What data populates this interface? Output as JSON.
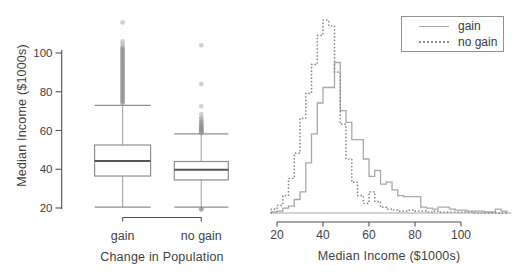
{
  "figure": {
    "width": 522,
    "height": 279,
    "background": "#ffffff",
    "colors": {
      "text": "#3f3f3f",
      "axis": "#4f4f4f",
      "solid_line": "#a8a8a8",
      "dotted_line": "#8a8a8a",
      "box_stroke": "#8f8f8f",
      "median_line": "#575757",
      "whisker": "#adadad",
      "outlier": "#8f8f8f"
    }
  },
  "chart_data": [
    {
      "type": "boxplot",
      "title": "",
      "xlabel": "Change in Population",
      "ylabel": "Median Income ($1000s)",
      "ylim": [
        15,
        118
      ],
      "y_ticks": [
        20,
        40,
        60,
        80,
        100
      ],
      "categories": [
        "gain",
        "no gain"
      ],
      "boxes": [
        {
          "group": "gain",
          "whisker_low": 20.5,
          "q1": 36.5,
          "median": 44.2,
          "q3": 52.5,
          "whisker_high": 73,
          "outliers": [
            74,
            74.5,
            75,
            75.5,
            76,
            76.5,
            77,
            77.5,
            78,
            78.5,
            79,
            79.5,
            80,
            80.5,
            81,
            81.5,
            82,
            82.5,
            83,
            83.5,
            84,
            84.5,
            85,
            85.5,
            86,
            86.5,
            87,
            87.5,
            88,
            88.5,
            89,
            89.5,
            90,
            90.5,
            91,
            91.5,
            92,
            92.5,
            93,
            93.5,
            94,
            94.5,
            95,
            95.5,
            96,
            96.5,
            97,
            97.5,
            98,
            98.5,
            99,
            99.5,
            100,
            100.5,
            101,
            101.5,
            102,
            102.5,
            103,
            104.5,
            106,
            115.8
          ]
        },
        {
          "group": "no gain",
          "whisker_low": 20.5,
          "q1": 34.5,
          "median": 39.8,
          "q3": 44,
          "whisker_high": 58.3,
          "outliers": [
            19.2,
            19.4,
            19.6,
            58.6,
            58.9,
            59.2,
            59.5,
            59.8,
            60.1,
            60.4,
            60.7,
            61,
            61.4,
            61.8,
            62.2,
            62.6,
            63,
            63.5,
            64,
            64.5,
            65.2,
            66,
            66.8,
            68.5,
            72.5,
            84,
            104
          ]
        }
      ]
    },
    {
      "type": "histogram",
      "title": "",
      "xlabel": "Median Income ($1000s)",
      "x_ticks": [
        20,
        40,
        60,
        80,
        100
      ],
      "xlim": [
        15,
        122
      ],
      "bin_start": 17.5,
      "bin_width": 2.5,
      "y_unit": "relative frequency (% of max)",
      "legend": {
        "position": "top-right",
        "items": [
          {
            "name": "gain",
            "line": "solid"
          },
          {
            "name": "no gain",
            "line": "dotted"
          }
        ]
      },
      "series": [
        {
          "name": "gain",
          "style": "solid",
          "heights": [
            0.5,
            1,
            2.5,
            3.5,
            7,
            11,
            26,
            41,
            57,
            65,
            65,
            78,
            53,
            47,
            38,
            38,
            28,
            19,
            22,
            15,
            16,
            12,
            9,
            8.5,
            8.5,
            8.5,
            3,
            2.5,
            2,
            3,
            3,
            2,
            1.5,
            1.5,
            1,
            1,
            1,
            0.5,
            0.5,
            2,
            1
          ]
        },
        {
          "name": "no gain",
          "style": "dotted",
          "heights": [
            2,
            4,
            9,
            18,
            31,
            49,
            62,
            77,
            92,
            100,
            97,
            73,
            46,
            28,
            16,
            9,
            5,
            11,
            6,
            3,
            2,
            1.5,
            1,
            1,
            1.5,
            1,
            1,
            0.5,
            1,
            0.5,
            0.5,
            0.5,
            0.5,
            0.5,
            0.5,
            0,
            0,
            0,
            0,
            0,
            0
          ]
        }
      ]
    }
  ]
}
